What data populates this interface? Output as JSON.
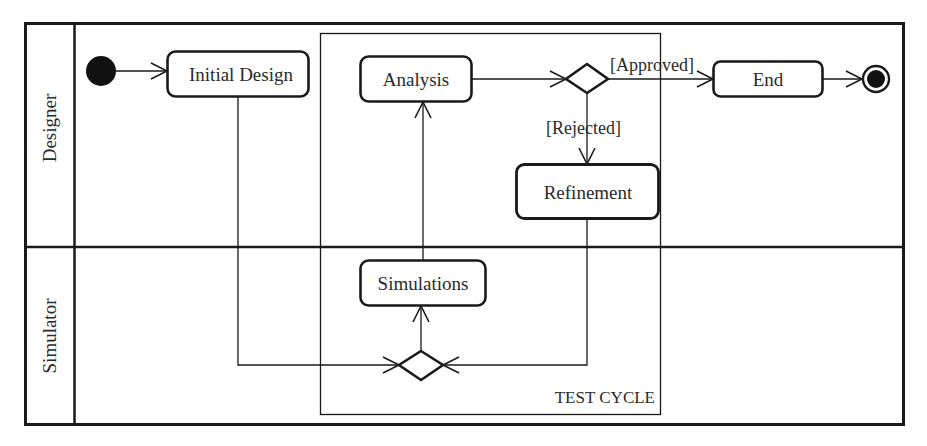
{
  "diagram": {
    "type": "UML activity diagram with swimlanes",
    "lanes": [
      {
        "id": "designer",
        "label": "Designer"
      },
      {
        "id": "simulator",
        "label": "Simulator"
      }
    ],
    "region": {
      "label": "TEST CYCLE"
    },
    "nodes": {
      "initial_design": {
        "label": "Initial Design",
        "lane": "Designer"
      },
      "analysis": {
        "label": "Analysis",
        "lane": "Designer"
      },
      "refinement": {
        "label": "Refinement",
        "lane": "Designer"
      },
      "end": {
        "label": "End",
        "lane": "Designer"
      },
      "simulations": {
        "label": "Simulations",
        "lane": "Simulator"
      }
    },
    "guards": {
      "approved": "[Approved]",
      "rejected": "[Rejected]"
    },
    "edges": [
      {
        "from": "start",
        "to": "Initial Design"
      },
      {
        "from": "Initial Design",
        "to": "merge"
      },
      {
        "from": "Refinement",
        "to": "merge"
      },
      {
        "from": "merge",
        "to": "Simulations"
      },
      {
        "from": "Simulations",
        "to": "Analysis"
      },
      {
        "from": "Analysis",
        "to": "decision"
      },
      {
        "from": "decision",
        "to": "End",
        "guard": "[Approved]"
      },
      {
        "from": "decision",
        "to": "Refinement",
        "guard": "[Rejected]"
      },
      {
        "from": "End",
        "to": "final"
      }
    ],
    "colors": {
      "stroke": "#1a1a1a",
      "text": "#2a2a2a",
      "background": "#ffffff"
    }
  }
}
